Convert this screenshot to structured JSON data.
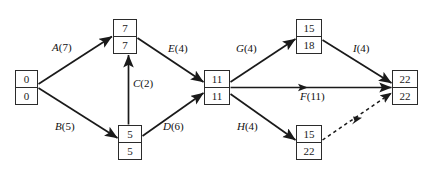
{
  "diagram": {
    "type": "activity-on-arrow-network",
    "nodes": [
      {
        "id": "n1",
        "top": "0",
        "bottom": "0",
        "x": 15,
        "y": 70,
        "w": 23,
        "h": 35
      },
      {
        "id": "n2",
        "top": "7",
        "bottom": "7",
        "x": 113,
        "y": 19,
        "w": 24,
        "h": 35
      },
      {
        "id": "n3",
        "top": "5",
        "bottom": "5",
        "x": 118,
        "y": 125,
        "w": 24,
        "h": 35
      },
      {
        "id": "n4",
        "top": "11",
        "bottom": "11",
        "x": 204,
        "y": 70,
        "w": 26,
        "h": 35
      },
      {
        "id": "n5",
        "top": "15",
        "bottom": "18",
        "x": 296,
        "y": 19,
        "w": 26,
        "h": 35
      },
      {
        "id": "n6",
        "top": "15",
        "bottom": "22",
        "x": 296,
        "y": 125,
        "w": 26,
        "h": 35
      },
      {
        "id": "n7",
        "top": "22",
        "bottom": "22",
        "x": 392,
        "y": 70,
        "w": 26,
        "h": 35
      }
    ],
    "edges": [
      {
        "id": "A",
        "letter": "A",
        "duration": "(7)",
        "style": "solid",
        "from": "n1",
        "to": "n2"
      },
      {
        "id": "B",
        "letter": "B",
        "duration": "(5)",
        "style": "solid",
        "from": "n1",
        "to": "n3"
      },
      {
        "id": "C",
        "letter": "C",
        "duration": "(2)",
        "style": "solid",
        "from": "n3",
        "to": "n2"
      },
      {
        "id": "D",
        "letter": "D",
        "duration": "(6)",
        "style": "solid",
        "from": "n3",
        "to": "n4"
      },
      {
        "id": "E",
        "letter": "E",
        "duration": "(4)",
        "style": "solid",
        "from": "n2",
        "to": "n4"
      },
      {
        "id": "G",
        "letter": "G",
        "duration": "(4)",
        "style": "solid",
        "from": "n4",
        "to": "n5"
      },
      {
        "id": "I",
        "letter": "I",
        "duration": "(4)",
        "style": "solid",
        "from": "n5",
        "to": "n7"
      },
      {
        "id": "F",
        "letter": "F",
        "duration": "(11)",
        "style": "solid",
        "from": "n4",
        "to": "n7"
      },
      {
        "id": "H",
        "letter": "H",
        "duration": "(4)",
        "style": "solid",
        "from": "n4",
        "to": "n6"
      },
      {
        "id": "dummy",
        "letter": "",
        "duration": "",
        "style": "dashed",
        "from": "n6",
        "to": "n7"
      }
    ],
    "labels": [
      {
        "id": "A",
        "letter": "A",
        "duration": "(7)",
        "x": 52,
        "y": 42
      },
      {
        "id": "B",
        "letter": "B",
        "duration": "(5)",
        "x": 55,
        "y": 121
      },
      {
        "id": "C",
        "letter": "C",
        "duration": "(2)",
        "x": 131,
        "y": 78
      },
      {
        "id": "D",
        "letter": "D",
        "duration": "(6)",
        "x": 163,
        "y": 121
      },
      {
        "id": "E",
        "letter": "E",
        "duration": "(4)",
        "x": 168,
        "y": 43
      },
      {
        "id": "G",
        "letter": "G",
        "duration": "(4)",
        "x": 236,
        "y": 43
      },
      {
        "id": "I",
        "letter": "I",
        "duration": "(4)",
        "x": 353,
        "y": 43
      },
      {
        "id": "F",
        "letter": "F",
        "duration": "(11)",
        "x": 300,
        "y": 91
      },
      {
        "id": "H",
        "letter": "H",
        "duration": "(4)",
        "x": 237,
        "y": 121
      }
    ],
    "colors": {
      "stroke": "#2b2b2b",
      "line": "#1a1a1a",
      "text": "#111111",
      "background": "#ffffff"
    }
  }
}
